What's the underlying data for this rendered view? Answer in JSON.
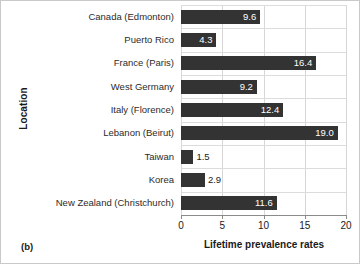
{
  "panel": {
    "tag": "(b)"
  },
  "chart_data": {
    "type": "bar",
    "orientation": "horizontal",
    "title": "",
    "subtitle": "",
    "xlabel": "Lifetime prevalence rates",
    "ylabel": "Location",
    "categories": [
      "Canada (Edmonton)",
      "Puerto Rico",
      "France (Paris)",
      "West Germany",
      "Italy (Florence)",
      "Lebanon (Beirut)",
      "Taiwan",
      "Korea",
      "New Zealand (Christchurch)"
    ],
    "values": [
      9.6,
      4.3,
      16.4,
      9.2,
      12.4,
      19.0,
      1.5,
      2.9,
      11.6
    ],
    "value_labels": [
      "9.6",
      "4.3",
      "16.4",
      "9.2",
      "12.4",
      "19.0",
      "1.5",
      "2.9",
      "11.6"
    ],
    "xlim": [
      0,
      20
    ],
    "xticks": [
      0,
      5,
      10,
      15,
      20
    ],
    "xtick_labels": [
      "0",
      "5",
      "10",
      "15",
      "20"
    ],
    "grid": true,
    "legend": "none",
    "bar_color": "#333333",
    "grid_color": "#d7d7d7",
    "label_inside_color": "#ffffff",
    "label_outside_color": "#1a1a1a"
  }
}
